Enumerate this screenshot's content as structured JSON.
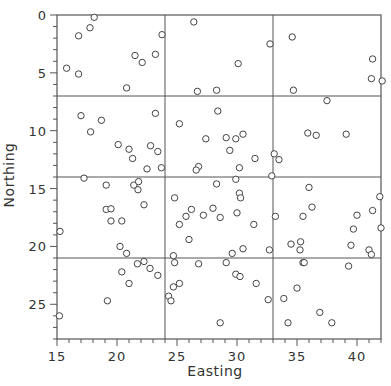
{
  "chart_data": {
    "type": "scatter",
    "title": "",
    "xlabel": "Easting",
    "ylabel": "Northing",
    "xlim": [
      15,
      42
    ],
    "ylim": [
      0,
      28
    ],
    "y_inverted": true,
    "x_ticks": [
      15,
      20,
      25,
      30,
      35,
      40
    ],
    "y_ticks": [
      0,
      5,
      10,
      15,
      20,
      25
    ],
    "grid_lines": {
      "x": [
        24,
        33
      ],
      "y": [
        7,
        14,
        21
      ]
    },
    "marker": "open-circle",
    "legend": null,
    "points": [
      [
        18.1,
        0.2
      ],
      [
        17.75,
        1.1
      ],
      [
        16.8,
        1.8
      ],
      [
        15.8,
        4.6
      ],
      [
        16.8,
        5.1
      ],
      [
        21.5,
        3.5
      ],
      [
        22.1,
        4.1
      ],
      [
        23.2,
        3.4
      ],
      [
        23.75,
        1.7
      ],
      [
        20.8,
        6.3
      ],
      [
        26.4,
        0.6
      ],
      [
        32.75,
        2.5
      ],
      [
        30.1,
        4.2
      ],
      [
        26.7,
        6.6
      ],
      [
        28.3,
        6.5
      ],
      [
        34.6,
        1.9
      ],
      [
        41.3,
        3.8
      ],
      [
        41.2,
        5.5
      ],
      [
        42.1,
        5.7
      ],
      [
        34.7,
        6.5
      ],
      [
        37.5,
        7.4
      ],
      [
        17.0,
        8.7
      ],
      [
        18.7,
        9.1
      ],
      [
        17.8,
        10.1
      ],
      [
        23.2,
        8.5
      ],
      [
        20.1,
        11.2
      ],
      [
        21.0,
        11.6
      ],
      [
        22.8,
        11.3
      ],
      [
        23.4,
        11.8
      ],
      [
        21.3,
        12.4
      ],
      [
        22.5,
        13.3
      ],
      [
        23.7,
        13.2
      ],
      [
        28.4,
        8.3
      ],
      [
        25.2,
        9.4
      ],
      [
        27.4,
        10.7
      ],
      [
        29.1,
        10.6
      ],
      [
        29.9,
        10.7
      ],
      [
        30.5,
        10.3
      ],
      [
        29.4,
        11.7
      ],
      [
        26.8,
        13.1
      ],
      [
        26.6,
        13.4
      ],
      [
        30.2,
        13.2
      ],
      [
        31.5,
        12.4
      ],
      [
        33.1,
        12.0
      ],
      [
        33.5,
        12.5
      ],
      [
        32.9,
        13.9
      ],
      [
        35.9,
        10.2
      ],
      [
        36.6,
        10.4
      ],
      [
        39.1,
        10.3
      ],
      [
        17.25,
        14.1
      ],
      [
        19.1,
        14.7
      ],
      [
        21.4,
        14.7
      ],
      [
        21.8,
        14.4
      ],
      [
        21.75,
        15.1
      ],
      [
        22.25,
        16.4
      ],
      [
        19.1,
        16.8
      ],
      [
        19.5,
        16.75
      ],
      [
        19.5,
        17.8
      ],
      [
        20.4,
        17.8
      ],
      [
        15.25,
        18.7
      ],
      [
        20.25,
        20.0
      ],
      [
        20.8,
        20.6
      ],
      [
        29.9,
        14.2
      ],
      [
        28.3,
        14.6
      ],
      [
        24.8,
        15.8
      ],
      [
        30.2,
        15.4
      ],
      [
        30.3,
        15.8
      ],
      [
        26.2,
        16.8
      ],
      [
        25.75,
        17.4
      ],
      [
        28.0,
        16.7
      ],
      [
        27.2,
        17.3
      ],
      [
        28.6,
        17.5
      ],
      [
        30.0,
        17.1
      ],
      [
        25.2,
        18.1
      ],
      [
        31.4,
        18.1
      ],
      [
        33.2,
        17.4
      ],
      [
        26.0,
        19.4
      ],
      [
        24.7,
        20.8
      ],
      [
        29.6,
        20.6
      ],
      [
        30.5,
        20.2
      ],
      [
        32.7,
        20.3
      ],
      [
        36.0,
        14.9
      ],
      [
        41.9,
        15.7
      ],
      [
        36.25,
        16.6
      ],
      [
        35.5,
        17.4
      ],
      [
        40.0,
        17.3
      ],
      [
        41.3,
        16.9
      ],
      [
        39.7,
        18.5
      ],
      [
        42.0,
        18.4
      ],
      [
        34.5,
        19.8
      ],
      [
        35.3,
        19.6
      ],
      [
        35.25,
        20.3
      ],
      [
        39.5,
        19.9
      ],
      [
        41.0,
        20.3
      ],
      [
        41.2,
        20.7
      ],
      [
        21.7,
        21.5
      ],
      [
        22.25,
        21.3
      ],
      [
        20.4,
        22.2
      ],
      [
        22.75,
        21.9
      ],
      [
        23.4,
        22.5
      ],
      [
        21.0,
        23.2
      ],
      [
        19.2,
        24.7
      ],
      [
        15.2,
        26.0
      ],
      [
        24.8,
        21.4
      ],
      [
        26.8,
        21.5
      ],
      [
        29.1,
        21.4
      ],
      [
        29.9,
        22.4
      ],
      [
        30.25,
        22.6
      ],
      [
        31.6,
        23.2
      ],
      [
        25.2,
        23.2
      ],
      [
        24.7,
        23.5
      ],
      [
        24.3,
        24.3
      ],
      [
        24.5,
        24.7
      ],
      [
        32.6,
        24.6
      ],
      [
        28.6,
        26.6
      ],
      [
        35.5,
        21.4
      ],
      [
        35.6,
        21.4
      ],
      [
        39.3,
        21.7
      ],
      [
        35.0,
        23.6
      ],
      [
        33.9,
        24.5
      ],
      [
        36.9,
        25.7
      ],
      [
        34.25,
        26.6
      ],
      [
        37.9,
        26.6
      ]
    ]
  },
  "colors": {
    "axis": "#555555",
    "grid": "#555555",
    "marker_stroke": "#444444",
    "marker_fill": "#ffffff",
    "text": "#333333"
  }
}
